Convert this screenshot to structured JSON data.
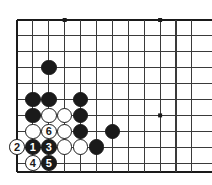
{
  "diagram": {
    "type": "go-board-diagram",
    "board": {
      "background_color": "#ffffff",
      "line_color": "#3a3a3a",
      "edge_line_color": "#1a1a1a",
      "columns": 12,
      "rows": 10,
      "origin_x": 17,
      "origin_y": 20,
      "spacing": 15.9,
      "left_edge_x": 17,
      "bottom_edge_y": 172,
      "top_edge_y": 20,
      "clipped_right": true,
      "clipped_top": false,
      "star_points": [
        {
          "name": "star-point-upper-left",
          "col": 3,
          "row": 0
        },
        {
          "name": "star-point-upper-right",
          "col": 9,
          "row": 0
        },
        {
          "name": "star-point-lower-right",
          "col": 9,
          "row": 6
        }
      ],
      "star_point_size": 4
    },
    "stone_radius": 7.8,
    "stones": [
      {
        "id": "stone-b-c2r3",
        "color": "black",
        "col": 2,
        "row": 3,
        "label": ""
      },
      {
        "id": "stone-b-c1r5",
        "color": "black",
        "col": 1,
        "row": 5,
        "label": ""
      },
      {
        "id": "stone-b-c2r5",
        "color": "black",
        "col": 2,
        "row": 5,
        "label": ""
      },
      {
        "id": "stone-b-c4r5",
        "color": "black",
        "col": 4,
        "row": 5,
        "label": ""
      },
      {
        "id": "stone-b-c1r6",
        "color": "black",
        "col": 1,
        "row": 6,
        "label": ""
      },
      {
        "id": "stone-w-c2r6",
        "color": "white",
        "col": 2,
        "row": 6,
        "label": ""
      },
      {
        "id": "stone-w-c3r6",
        "color": "white",
        "col": 3,
        "row": 6,
        "label": ""
      },
      {
        "id": "stone-b-c4r6",
        "color": "black",
        "col": 4,
        "row": 6,
        "label": ""
      },
      {
        "id": "stone-w-c1r7",
        "color": "white",
        "col": 1,
        "row": 7,
        "label": ""
      },
      {
        "id": "stone-w-c2r7",
        "color": "white",
        "col": 2,
        "row": 7,
        "label": "6"
      },
      {
        "id": "stone-w-c3r7",
        "color": "white",
        "col": 3,
        "row": 7,
        "label": ""
      },
      {
        "id": "stone-b-c4r7",
        "color": "black",
        "col": 4,
        "row": 7,
        "label": ""
      },
      {
        "id": "stone-b-c6r7",
        "color": "black",
        "col": 6,
        "row": 7,
        "label": ""
      },
      {
        "id": "stone-w-c0r8",
        "color": "white",
        "col": 0,
        "row": 8,
        "label": "2"
      },
      {
        "id": "stone-b-c1r8",
        "color": "black",
        "col": 1,
        "row": 8,
        "label": "1"
      },
      {
        "id": "stone-b-c2r8",
        "color": "black",
        "col": 2,
        "row": 8,
        "label": "3"
      },
      {
        "id": "stone-w-c3r8",
        "color": "white",
        "col": 3,
        "row": 8,
        "label": ""
      },
      {
        "id": "stone-w-c4r8",
        "color": "white",
        "col": 4,
        "row": 8,
        "label": ""
      },
      {
        "id": "stone-b-c5r8",
        "color": "black",
        "col": 5,
        "row": 8,
        "label": ""
      },
      {
        "id": "stone-w-c1r9",
        "color": "white",
        "col": 1,
        "row": 9,
        "label": "4"
      },
      {
        "id": "stone-b-c2r9",
        "color": "black",
        "col": 2,
        "row": 9,
        "label": "5"
      }
    ],
    "move_numbers": {
      "1": "black",
      "2": "white",
      "3": "black",
      "4": "white",
      "5": "black",
      "6": "white"
    }
  }
}
